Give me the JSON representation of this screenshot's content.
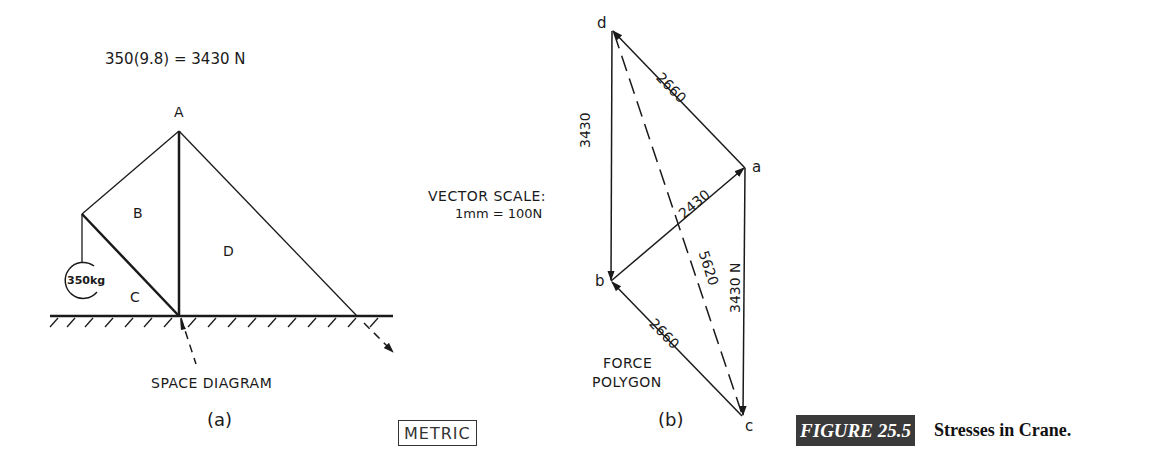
{
  "space_diagram": {
    "weight_equation": "350(9.8) = 3430 N",
    "joint_label_A": "A",
    "region_labels": {
      "B": "B",
      "C": "C",
      "D": "D"
    },
    "load_label": "350kg",
    "title": "SPACE DIAGRAM",
    "sub_label": "(a)"
  },
  "force_polygon": {
    "vector_scale_title": "VECTOR SCALE:",
    "vector_scale_value": "1mm = 100N",
    "points": {
      "a": "a",
      "b": "b",
      "c": "c",
      "d": "d"
    },
    "vectors": [
      {
        "from": "d",
        "to": "b",
        "label": "3430"
      },
      {
        "from": "a",
        "to": "d",
        "label": "2660"
      },
      {
        "from": "b",
        "to": "a",
        "label": "2430"
      },
      {
        "from": "a",
        "to": "c",
        "label": "3430 N"
      },
      {
        "from": "c",
        "to": "b",
        "label": "2660"
      },
      {
        "from": "d",
        "to": "c",
        "label": "5620",
        "style": "dashed"
      }
    ],
    "title_line1": "FORCE",
    "title_line2": "POLYGON",
    "sub_label": "(b)"
  },
  "units_badge": "METRIC",
  "figure": {
    "number": "FIGURE 25.5",
    "caption": "Stresses in Crane.",
    "badge_color": "#3a3a3a"
  }
}
